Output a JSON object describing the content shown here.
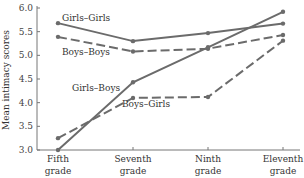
{
  "chart_data": {
    "type": "line",
    "title": "",
    "xlabel": "",
    "ylabel": "Mean intimacy scores",
    "ylim": [
      3.0,
      6.0
    ],
    "yticks": [
      "3.0",
      "3.5",
      "4.0",
      "4.5",
      "5.0",
      "5.5",
      "6.0"
    ],
    "categories": [
      "Fifth grade",
      "Seventh grade",
      "Ninth grade",
      "Eleventh grade"
    ],
    "category_lines": [
      [
        "Fifth",
        "grade"
      ],
      [
        "Seventh",
        "grade"
      ],
      [
        "Ninth",
        "grade"
      ],
      [
        "Eleventh",
        "grade"
      ]
    ],
    "grid": false,
    "legend_position": "inline labels",
    "series": [
      {
        "name": "Girls–Girls",
        "values": [
          5.68,
          5.3,
          5.47,
          5.67
        ],
        "style": "solid",
        "color": "#6b6b6b"
      },
      {
        "name": "Boys–Boys",
        "values": [
          5.39,
          5.08,
          5.14,
          5.43
        ],
        "style": "dashed",
        "color": "#6b6b6b"
      },
      {
        "name": "Girls–Boys",
        "values": [
          3.0,
          4.43,
          5.17,
          5.92
        ],
        "style": "solid",
        "color": "#6b6b6b"
      },
      {
        "name": "Boys–Girls",
        "values": [
          3.25,
          4.1,
          4.12,
          5.31
        ],
        "style": "dashed",
        "color": "#6b6b6b"
      }
    ],
    "annotations": [
      {
        "text": "Girls–Girls",
        "series": "Girls–Girls"
      },
      {
        "text": "Boys–Boys",
        "series": "Boys–Boys"
      },
      {
        "text": "Girls–Boys",
        "series": "Girls–Boys"
      },
      {
        "text": "Boys–Girls",
        "series": "Boys–Girls"
      }
    ]
  }
}
